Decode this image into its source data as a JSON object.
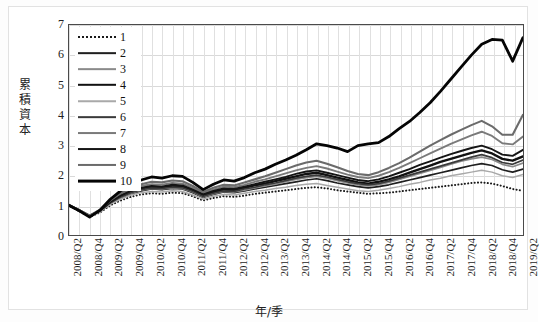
{
  "chart_data": {
    "type": "line",
    "title": "",
    "xlabel": "年/季",
    "ylabel": "累積資本",
    "ylim": [
      0,
      7
    ],
    "yticks": [
      0,
      1,
      2,
      3,
      4,
      5,
      6,
      7
    ],
    "grid": true,
    "legend_position": "top-left",
    "x": [
      "2008/Q2",
      "2008/Q3",
      "2008/Q4",
      "2009/Q1",
      "2009/Q2",
      "2009/Q3",
      "2009/Q4",
      "2010/Q1",
      "2010/Q2",
      "2010/Q3",
      "2010/Q4",
      "2011/Q1",
      "2011/Q2",
      "2011/Q3",
      "2011/Q4",
      "2012/Q1",
      "2012/Q2",
      "2012/Q3",
      "2012/Q4",
      "2013/Q1",
      "2013/Q2",
      "2013/Q3",
      "2013/Q4",
      "2014/Q1",
      "2014/Q2",
      "2014/Q3",
      "2014/Q4",
      "2015/Q1",
      "2015/Q2",
      "2015/Q3",
      "2015/Q4",
      "2016/Q1",
      "2016/Q2",
      "2016/Q3",
      "2016/Q4",
      "2017/Q1",
      "2017/Q2",
      "2017/Q3",
      "2017/Q4",
      "2018/Q1",
      "2018/Q2",
      "2018/Q3",
      "2018/Q4",
      "2019/Q1",
      "2019/Q2"
    ],
    "xtick_labels": [
      "2008/Q2",
      "2008/Q4",
      "2009/Q2",
      "2009/Q4",
      "2010/Q2",
      "2010/Q4",
      "2011/Q2",
      "2011/Q4",
      "2012/Q2",
      "2012/Q4",
      "2013/Q2",
      "2013/Q4",
      "2014/Q2",
      "2014/Q4",
      "2015/Q2",
      "2015/Q4",
      "2016/Q2",
      "2016/Q4",
      "2017/Q2",
      "2017/Q4",
      "2018/Q2",
      "2018/Q4",
      "2019/Q2"
    ],
    "series": [
      {
        "name": "1",
        "style": "dotted",
        "color": "#1a1a1a",
        "width": 2.0,
        "values": [
          1.02,
          0.82,
          0.64,
          0.78,
          1.02,
          1.18,
          1.3,
          1.38,
          1.42,
          1.4,
          1.44,
          1.42,
          1.32,
          1.18,
          1.26,
          1.32,
          1.3,
          1.34,
          1.4,
          1.44,
          1.48,
          1.52,
          1.56,
          1.6,
          1.62,
          1.58,
          1.52,
          1.48,
          1.44,
          1.4,
          1.42,
          1.44,
          1.48,
          1.52,
          1.56,
          1.6,
          1.64,
          1.68,
          1.72,
          1.76,
          1.78,
          1.74,
          1.66,
          1.56,
          1.5
        ]
      },
      {
        "name": "2",
        "style": "solid",
        "color": "#1f1f1f",
        "width": 1.7,
        "values": [
          1.02,
          0.84,
          0.66,
          0.82,
          1.08,
          1.26,
          1.4,
          1.5,
          1.56,
          1.54,
          1.58,
          1.56,
          1.44,
          1.28,
          1.38,
          1.46,
          1.44,
          1.5,
          1.56,
          1.62,
          1.68,
          1.74,
          1.8,
          1.86,
          1.9,
          1.84,
          1.76,
          1.7,
          1.64,
          1.6,
          1.64,
          1.7,
          1.78,
          1.86,
          1.94,
          2.02,
          2.1,
          2.18,
          2.26,
          2.34,
          2.4,
          2.34,
          2.2,
          2.12,
          2.22
        ]
      },
      {
        "name": "3",
        "style": "solid",
        "color": "#8a8a8a",
        "width": 1.7,
        "values": [
          1.02,
          0.84,
          0.66,
          0.82,
          1.08,
          1.28,
          1.42,
          1.52,
          1.58,
          1.56,
          1.6,
          1.58,
          1.46,
          1.3,
          1.4,
          1.48,
          1.46,
          1.52,
          1.6,
          1.66,
          1.72,
          1.8,
          1.88,
          1.94,
          1.98,
          1.92,
          1.84,
          1.76,
          1.7,
          1.66,
          1.7,
          1.78,
          1.88,
          1.98,
          2.08,
          2.18,
          2.28,
          2.38,
          2.48,
          2.56,
          2.62,
          2.54,
          2.38,
          2.3,
          2.42
        ]
      },
      {
        "name": "4",
        "style": "solid",
        "color": "#111111",
        "width": 2.4,
        "values": [
          1.02,
          0.85,
          0.67,
          0.84,
          1.12,
          1.32,
          1.48,
          1.58,
          1.64,
          1.62,
          1.66,
          1.64,
          1.52,
          1.34,
          1.46,
          1.54,
          1.52,
          1.6,
          1.68,
          1.74,
          1.82,
          1.9,
          1.98,
          2.06,
          2.1,
          2.02,
          1.94,
          1.86,
          1.78,
          1.74,
          1.8,
          1.88,
          1.98,
          2.1,
          2.22,
          2.34,
          2.46,
          2.56,
          2.66,
          2.76,
          2.84,
          2.74,
          2.56,
          2.5,
          2.64
        ]
      },
      {
        "name": "5",
        "style": "solid",
        "color": "#a9a9a9",
        "width": 1.5,
        "values": [
          1.02,
          0.83,
          0.65,
          0.8,
          1.05,
          1.22,
          1.36,
          1.44,
          1.48,
          1.46,
          1.5,
          1.48,
          1.36,
          1.22,
          1.32,
          1.38,
          1.36,
          1.42,
          1.48,
          1.52,
          1.58,
          1.62,
          1.68,
          1.72,
          1.74,
          1.68,
          1.62,
          1.56,
          1.5,
          1.48,
          1.52,
          1.58,
          1.64,
          1.72,
          1.78,
          1.86,
          1.92,
          2.0,
          2.06,
          2.12,
          2.18,
          2.12,
          2.0,
          1.94,
          2.04
        ]
      },
      {
        "name": "6",
        "style": "solid",
        "color": "#3a3a3a",
        "width": 1.7,
        "values": [
          1.02,
          0.84,
          0.66,
          0.83,
          1.1,
          1.3,
          1.44,
          1.54,
          1.6,
          1.58,
          1.62,
          1.6,
          1.48,
          1.32,
          1.42,
          1.5,
          1.48,
          1.56,
          1.62,
          1.7,
          1.76,
          1.84,
          1.92,
          1.98,
          2.02,
          1.96,
          1.88,
          1.8,
          1.74,
          1.7,
          1.74,
          1.82,
          1.92,
          2.02,
          2.12,
          2.22,
          2.32,
          2.42,
          2.52,
          2.62,
          2.7,
          2.6,
          2.44,
          2.38,
          2.52
        ]
      },
      {
        "name": "7",
        "style": "solid",
        "color": "#7a7a7a",
        "width": 1.9,
        "values": [
          1.02,
          0.86,
          0.68,
          0.86,
          1.16,
          1.38,
          1.54,
          1.66,
          1.72,
          1.7,
          1.76,
          1.74,
          1.6,
          1.42,
          1.54,
          1.64,
          1.62,
          1.7,
          1.8,
          1.88,
          1.98,
          2.08,
          2.18,
          2.26,
          2.32,
          2.24,
          2.14,
          2.04,
          1.96,
          1.92,
          2.0,
          2.12,
          2.26,
          2.42,
          2.58,
          2.74,
          2.9,
          3.06,
          3.2,
          3.34,
          3.46,
          3.32,
          3.08,
          3.04,
          3.3
        ]
      },
      {
        "name": "8",
        "style": "solid",
        "color": "#151515",
        "width": 1.9,
        "values": [
          1.02,
          0.85,
          0.67,
          0.84,
          1.13,
          1.34,
          1.5,
          1.6,
          1.66,
          1.64,
          1.7,
          1.68,
          1.54,
          1.38,
          1.5,
          1.58,
          1.56,
          1.64,
          1.72,
          1.8,
          1.88,
          1.96,
          2.06,
          2.14,
          2.18,
          2.1,
          2.02,
          1.94,
          1.86,
          1.82,
          1.88,
          1.98,
          2.1,
          2.22,
          2.36,
          2.48,
          2.6,
          2.72,
          2.82,
          2.92,
          3.0,
          2.88,
          2.7,
          2.66,
          2.86
        ]
      },
      {
        "name": "9",
        "style": "solid",
        "color": "#6b6b6b",
        "width": 2.1,
        "values": [
          1.02,
          0.86,
          0.68,
          0.88,
          1.18,
          1.42,
          1.6,
          1.72,
          1.8,
          1.78,
          1.84,
          1.82,
          1.66,
          1.46,
          1.6,
          1.7,
          1.68,
          1.78,
          1.88,
          1.98,
          2.1,
          2.22,
          2.34,
          2.44,
          2.5,
          2.4,
          2.28,
          2.16,
          2.06,
          2.02,
          2.12,
          2.26,
          2.42,
          2.6,
          2.8,
          3.0,
          3.18,
          3.36,
          3.52,
          3.68,
          3.82,
          3.64,
          3.36,
          3.36,
          4.02
        ]
      },
      {
        "name": "10",
        "style": "solid",
        "color": "#050505",
        "width": 2.8,
        "values": [
          1.02,
          0.84,
          0.63,
          0.86,
          1.22,
          1.5,
          1.7,
          1.86,
          1.96,
          1.92,
          2.0,
          1.98,
          1.78,
          1.54,
          1.72,
          1.86,
          1.82,
          1.94,
          2.1,
          2.22,
          2.38,
          2.52,
          2.68,
          2.86,
          3.06,
          3.0,
          2.92,
          2.8,
          3.0,
          3.06,
          3.1,
          3.3,
          3.56,
          3.8,
          4.1,
          4.42,
          4.8,
          5.2,
          5.6,
          6.0,
          6.36,
          6.52,
          6.5,
          5.8,
          6.58
        ]
      }
    ]
  },
  "legend": {
    "entries": [
      {
        "label": "1"
      },
      {
        "label": "2"
      },
      {
        "label": "3"
      },
      {
        "label": "4"
      },
      {
        "label": "5"
      },
      {
        "label": "6"
      },
      {
        "label": "7"
      },
      {
        "label": "8"
      },
      {
        "label": "9"
      },
      {
        "label": "10"
      }
    ]
  }
}
